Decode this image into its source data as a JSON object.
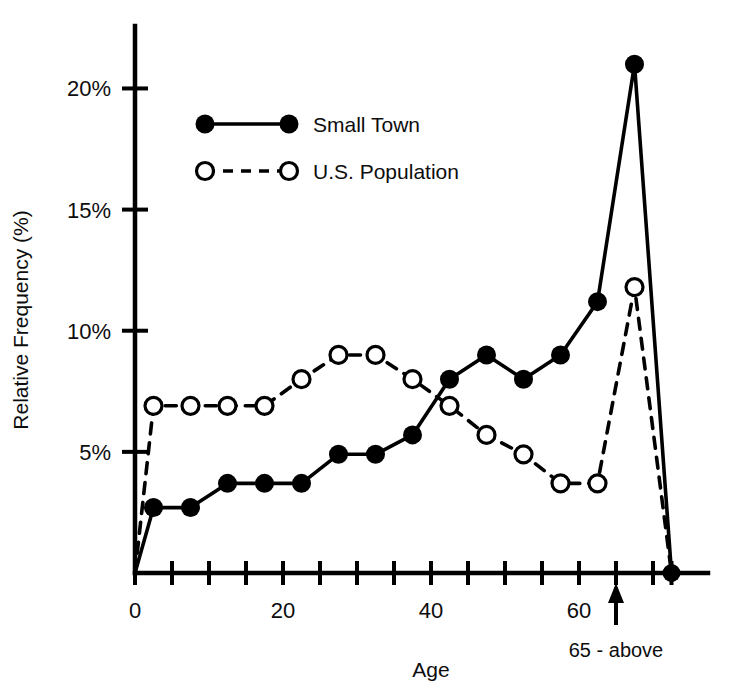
{
  "chart_data": {
    "type": "line",
    "title": "",
    "xlabel": "Age",
    "ylabel": "Relative Frequency (%)",
    "xlim": [
      0,
      75
    ],
    "ylim": [
      0,
      22
    ],
    "grid": false,
    "legend_position": "upper-left-inside",
    "x_ticks_major": [
      0,
      20,
      40,
      60
    ],
    "x_tick_labels": [
      "0",
      "20",
      "40",
      "60"
    ],
    "x_ticks_minor": [
      5,
      10,
      15,
      25,
      30,
      35,
      45,
      50,
      55,
      65,
      70
    ],
    "y_ticks": [
      5,
      10,
      15,
      20
    ],
    "y_tick_labels": [
      "5%",
      "10%",
      "15%",
      "20%"
    ],
    "x": [
      0,
      2.5,
      7.5,
      12.5,
      17.5,
      22.5,
      27.5,
      32.5,
      37.5,
      42.5,
      47.5,
      52.5,
      57.5,
      62.5,
      67.5,
      72.5
    ],
    "series": [
      {
        "name": "Small Town",
        "marker": "filled-circle",
        "line_style": "solid",
        "color": "#000000",
        "values": [
          0,
          2.7,
          2.7,
          3.7,
          3.7,
          3.7,
          4.9,
          4.9,
          5.7,
          8.0,
          9.0,
          8.0,
          9.0,
          11.2,
          21.0,
          0
        ]
      },
      {
        "name": "U.S. Population",
        "marker": "open-circle",
        "line_style": "dashed",
        "color": "#000000",
        "values": [
          0,
          6.9,
          6.9,
          6.9,
          6.9,
          8.0,
          9.0,
          9.0,
          8.0,
          6.9,
          5.7,
          4.9,
          3.7,
          3.7,
          11.8,
          0
        ]
      }
    ],
    "annotations": [
      {
        "name": "age-65-above",
        "text": "65 - above",
        "x": 65,
        "arrow": "up"
      }
    ]
  },
  "legend": {
    "entries": [
      {
        "label": "Small Town"
      },
      {
        "label": "U.S. Population"
      }
    ]
  },
  "axes": {
    "x_title": "Age",
    "y_title": "Relative Frequency (%)"
  }
}
